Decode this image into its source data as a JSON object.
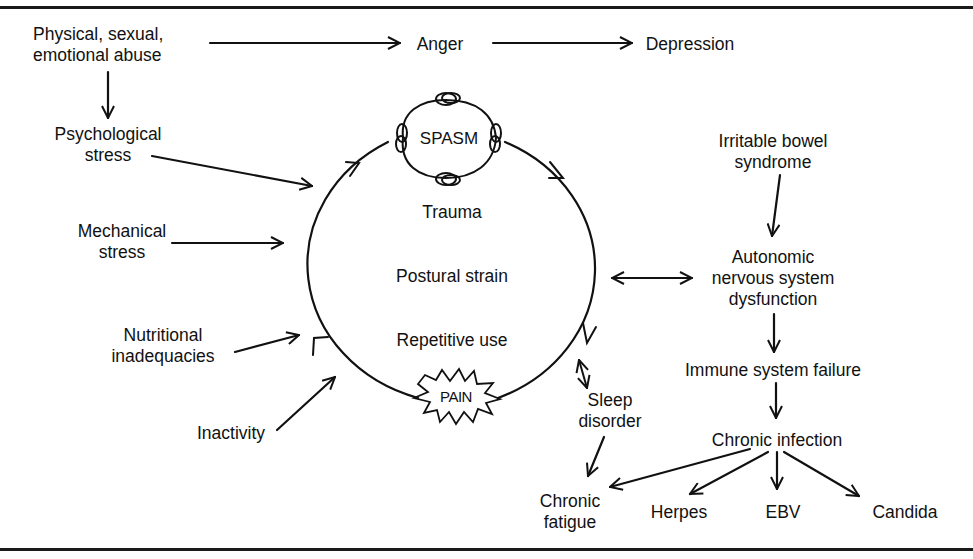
{
  "diagram": {
    "colors": {
      "ink": "#111111",
      "background": "#ffffff"
    },
    "cycle": {
      "center_terms": [
        "Trauma",
        "Postural strain",
        "Repetitive use"
      ],
      "top_node": "SPASM",
      "bottom_node": "PAIN"
    },
    "causes_left": {
      "abuse": "Physical, sexual,\nemotional abuse",
      "psychological_stress": "Psychological\nstress",
      "mechanical_stress": "Mechanical\nstress",
      "nutritional": "Nutritional\ninadequacies",
      "inactivity": "Inactivity"
    },
    "emotional_chain": {
      "anger": "Anger",
      "depression": "Depression"
    },
    "right_chain": {
      "ibs": "Irritable bowel\nsyndrome",
      "ans": "Autonomic\nnervous system\ndysfunction",
      "immune": "Immune system failure",
      "chronic_infection": "Chronic infection",
      "herpes": "Herpes",
      "ebv": "EBV",
      "candida": "Candida"
    },
    "sleep_chain": {
      "sleep_disorder": "Sleep\ndisorder",
      "chronic_fatigue": "Chronic\nfatigue"
    },
    "edges": [
      {
        "from": "Physical, sexual, emotional abuse",
        "to": "Anger"
      },
      {
        "from": "Anger",
        "to": "Depression"
      },
      {
        "from": "Physical, sexual, emotional abuse",
        "to": "Psychological stress"
      },
      {
        "from": "Psychological stress",
        "to": "cycle"
      },
      {
        "from": "Mechanical stress",
        "to": "cycle"
      },
      {
        "from": "Nutritional inadequacies",
        "to": "cycle"
      },
      {
        "from": "Inactivity",
        "to": "cycle"
      },
      {
        "from": "cycle",
        "to": "Autonomic nervous system dysfunction",
        "bidirectional": true
      },
      {
        "from": "Irritable bowel syndrome",
        "to": "Autonomic nervous system dysfunction"
      },
      {
        "from": "Autonomic nervous system dysfunction",
        "to": "Immune system failure"
      },
      {
        "from": "Immune system failure",
        "to": "Chronic infection"
      },
      {
        "from": "Chronic infection",
        "to": "Chronic fatigue"
      },
      {
        "from": "Chronic infection",
        "to": "Herpes"
      },
      {
        "from": "Chronic infection",
        "to": "EBV"
      },
      {
        "from": "Chronic infection",
        "to": "Candida"
      },
      {
        "from": "cycle",
        "to": "Sleep disorder",
        "bidirectional": true
      },
      {
        "from": "Sleep disorder",
        "to": "Chronic fatigue"
      }
    ]
  }
}
